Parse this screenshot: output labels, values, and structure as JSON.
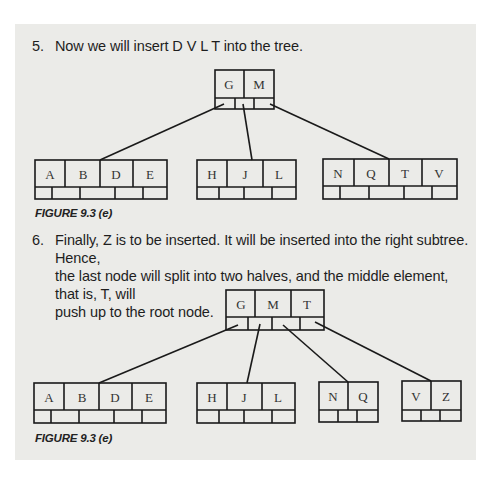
{
  "steps": [
    {
      "number": "5.",
      "lines": [
        "Now we will insert D V L T into the tree."
      ]
    },
    {
      "number": "6.",
      "lines": [
        "Finally, Z is to be inserted. It will be inserted into the right subtree. Hence,",
        "the last node will split into two halves, and the middle element, that is, T, will",
        "push up to the root node."
      ]
    }
  ],
  "figures": [
    {
      "caption": "FIGURE 9.3 (e)",
      "root": {
        "keys": [
          "G",
          "M"
        ]
      },
      "leaves": [
        {
          "keys": [
            "A",
            "B",
            "D",
            "E"
          ]
        },
        {
          "keys": [
            "H",
            "J",
            "L"
          ]
        },
        {
          "keys": [
            "N",
            "Q",
            "T",
            "V"
          ]
        }
      ]
    },
    {
      "caption": "FIGURE 9.3 (e)",
      "root": {
        "keys": [
          "G",
          "M",
          "T"
        ]
      },
      "leaves": [
        {
          "keys": [
            "A",
            "B",
            "D",
            "E"
          ]
        },
        {
          "keys": [
            "H",
            "J",
            "L"
          ]
        },
        {
          "keys": [
            "N",
            "Q"
          ]
        },
        {
          "keys": [
            "V",
            "Z"
          ]
        }
      ]
    }
  ]
}
